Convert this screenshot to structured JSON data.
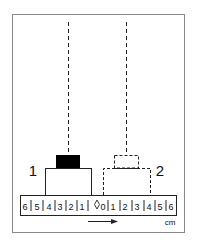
{
  "diagram": {
    "position_labels": [
      "1",
      "2"
    ],
    "ruler": {
      "ticks": [
        "6",
        "5",
        "4",
        "3",
        "2",
        "1",
        "0",
        "1",
        "2",
        "3",
        "4",
        "5",
        "6"
      ],
      "unit": "cm",
      "zero_marker": "diamond-marker"
    },
    "direction": "arrow-right",
    "colors": {
      "stroke": "#222222",
      "fill_block": "#000000",
      "frame": "#8a8a8a"
    }
  }
}
